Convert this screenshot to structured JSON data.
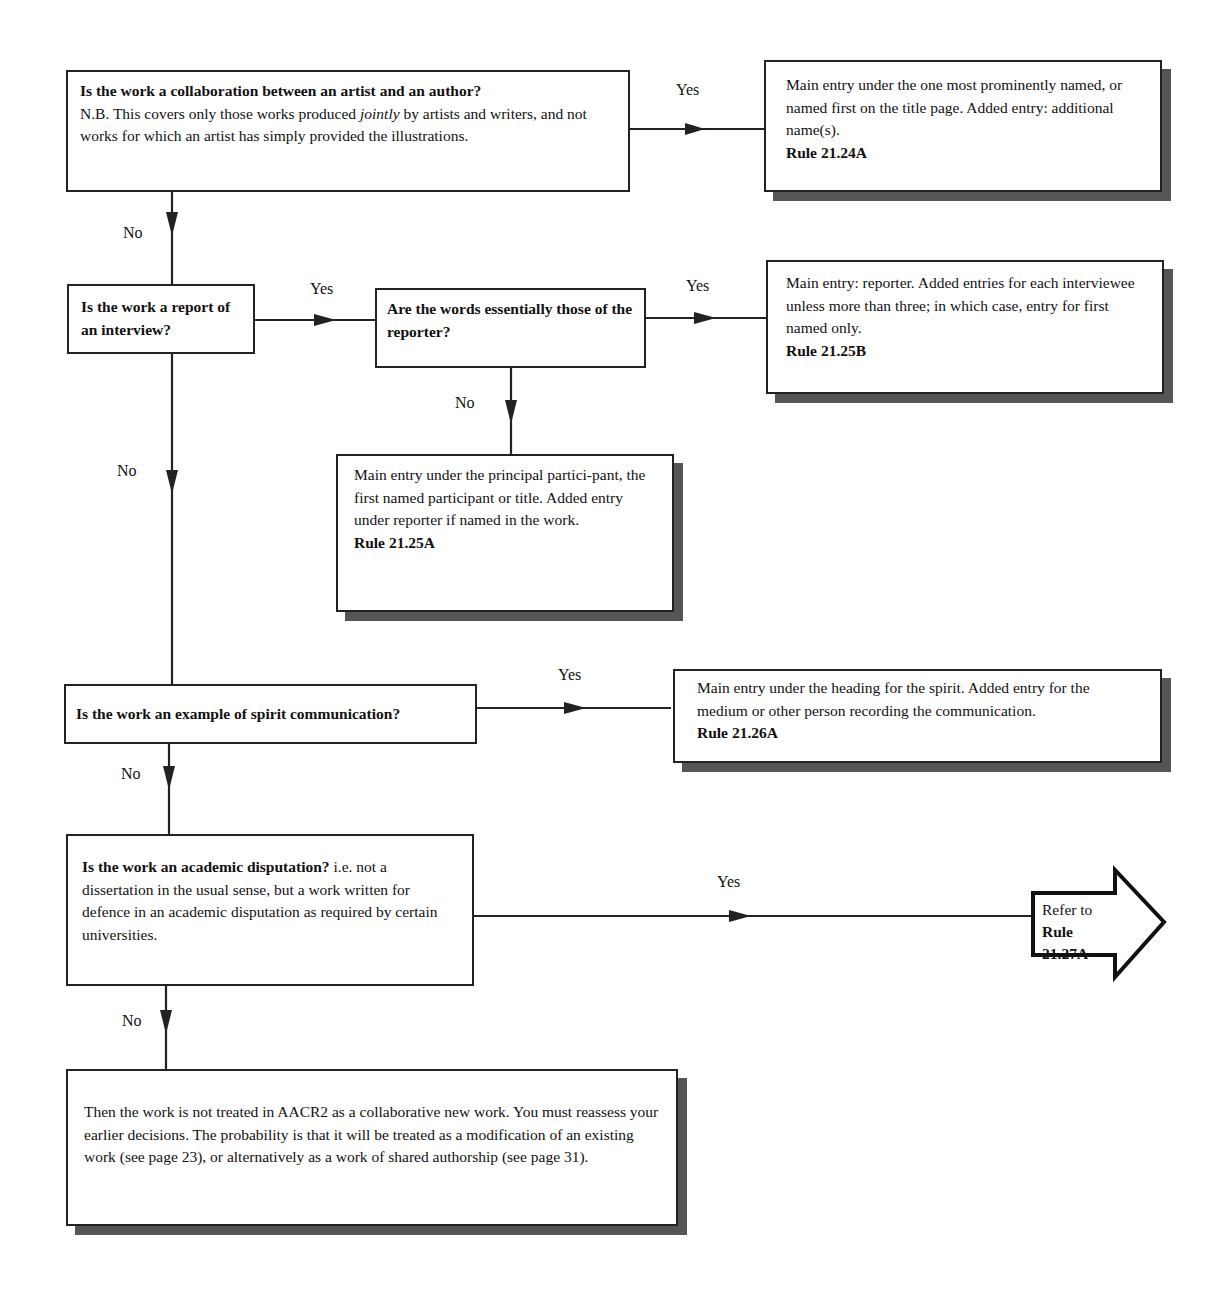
{
  "diagram": {
    "nodes": {
      "q1": {
        "question": "Is the work a collaboration between an artist and an author?",
        "note_pre": "N.B. This covers only those works produced ",
        "note_em": "jointly",
        "note_post": " by artists and writers, and not works for which an artist has simply provided the illustrations."
      },
      "r1": {
        "text": "Main entry under the one most prominently named, or named first on the title page. Added entry: additional name(s).",
        "rule": "Rule 21.24A"
      },
      "q2": {
        "question": "Is the work a report of an interview?"
      },
      "q3": {
        "question": "Are the words essentially those of the reporter?"
      },
      "r2": {
        "text": "Main entry: reporter. Added entries for each interviewee unless more than three; in which case, entry for first named only.",
        "rule": "Rule 21.25B"
      },
      "r3": {
        "text": "Main entry under the principal partici-pant, the first named participant or title. Added entry under reporter if named in the work.",
        "rule": "Rule 21.25A"
      },
      "q4": {
        "question": "Is the work an example of spirit communication?"
      },
      "r4": {
        "text": "Main entry under the heading for the spirit. Added entry for the medium or other person recording the communication.",
        "rule": "Rule 21.26A"
      },
      "q5": {
        "question": "Is the work an academic disputation?",
        "note": " i.e. not a dissertation in the usual sense, but a work written for defence in an academic disputation as required by certain universities."
      },
      "r5": {
        "prefix": "Refer to",
        "rule": "Rule 21.27A"
      },
      "end": {
        "text": "Then the work is not treated in AACR2 as a collaborative new work. You must reassess your earlier decisions. The probability is that it will be treated as a modification of an existing work (see page 23), or alternatively as a work of shared authorship (see page 31)."
      }
    },
    "edge_labels": {
      "q1_yes": "Yes",
      "q1_no": "No",
      "q2_yes": "Yes",
      "q2_no": "No",
      "q3_yes": "Yes",
      "q3_no": "No",
      "q4_yes": "Yes",
      "q4_no": "No",
      "q5_yes": "Yes",
      "q5_no": "No"
    }
  }
}
